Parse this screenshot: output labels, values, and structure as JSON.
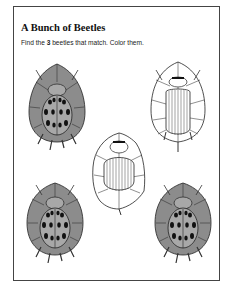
{
  "worksheet": {
    "title": "A Bunch of Beetles",
    "instruction": {
      "prefix": "Find the ",
      "count": "3",
      "suffix": " beetles that match. Color them."
    }
  },
  "beetles": [
    {
      "position": "top-left",
      "type": "spotted-ladybug",
      "shaded": true
    },
    {
      "position": "top-right",
      "type": "striped-beetle",
      "shaded": false
    },
    {
      "position": "center",
      "type": "striped-beetle",
      "shaded": false
    },
    {
      "position": "bottom-left",
      "type": "spotted-ladybug",
      "shaded": true
    },
    {
      "position": "bottom-right",
      "type": "spotted-ladybug",
      "shaded": true
    }
  ],
  "colors": {
    "shaded_fill": "#8c8c8c",
    "shell_fill": "#a8a8a8",
    "line": "#222222",
    "border": "#444444"
  }
}
